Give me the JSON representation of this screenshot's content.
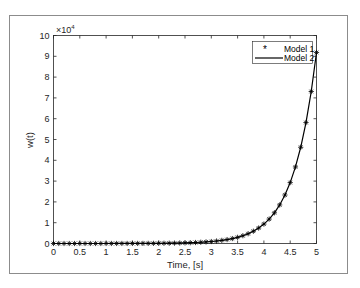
{
  "chart_data": {
    "type": "line",
    "title": "",
    "xlabel": "Time, [s]",
    "ylabel": "w(t)",
    "y_exponent_label": "×10",
    "y_exponent_power": "4",
    "xlim": [
      0,
      5
    ],
    "ylim": [
      0,
      100000
    ],
    "x_ticks": [
      "0",
      "0.5",
      "1",
      "1.5",
      "2",
      "2.5",
      "3",
      "3.5",
      "4",
      "4.5",
      "5"
    ],
    "y_ticks": [
      "0",
      "1",
      "2",
      "3",
      "4",
      "5",
      "6",
      "7",
      "8",
      "9",
      "10"
    ],
    "grid": false,
    "legend_position": "upper right",
    "x": [
      0,
      0.1,
      0.2,
      0.3,
      0.4,
      0.5,
      0.6,
      0.7,
      0.8,
      0.9,
      1,
      1.1,
      1.2,
      1.3,
      1.4,
      1.5,
      1.6,
      1.7,
      1.8,
      1.9,
      2,
      2.1,
      2.2,
      2.3,
      2.4,
      2.5,
      2.6,
      2.7,
      2.8,
      2.9,
      3,
      3.1,
      3.2,
      3.3,
      3.4,
      3.5,
      3.6,
      3.7,
      3.8,
      3.9,
      4,
      4.1,
      4.2,
      4.3,
      4.4,
      4.5,
      4.6,
      4.7,
      4.8,
      4.9,
      5
    ],
    "series": [
      {
        "name": "Model 1",
        "style": "asterisk markers",
        "values": [
          1,
          1.26,
          1.58,
          1.99,
          2.49,
          3.14,
          3.94,
          4.95,
          6.22,
          7.82,
          9.83,
          12.4,
          15.5,
          19.5,
          24.5,
          30.8,
          38.7,
          48.7,
          61.2,
          76.9,
          96.6,
          121,
          153,
          192,
          241,
          303,
          381,
          479,
          602,
          756,
          950,
          1194,
          1500,
          1886,
          2370,
          2979,
          3744,
          4705,
          5913,
          7432,
          9340,
          11739,
          14753,
          18542,
          23304,
          29289,
          36810,
          46263,
          58144,
          73075,
          91840
        ]
      },
      {
        "name": "Model 2",
        "style": "solid line",
        "values": [
          1,
          1.26,
          1.58,
          1.99,
          2.49,
          3.14,
          3.94,
          4.95,
          6.22,
          7.82,
          9.83,
          12.4,
          15.5,
          19.5,
          24.5,
          30.8,
          38.7,
          48.7,
          61.2,
          76.9,
          96.6,
          121,
          153,
          192,
          241,
          303,
          381,
          479,
          602,
          756,
          950,
          1194,
          1500,
          1886,
          2370,
          2979,
          3744,
          4705,
          5913,
          7432,
          9340,
          11739,
          14753,
          18542,
          23304,
          29289,
          36810,
          46263,
          58144,
          73075,
          91840
        ]
      }
    ]
  },
  "legend": {
    "items": [
      {
        "label": "Model 1",
        "symbol": "*"
      },
      {
        "label": "Model 2",
        "symbol": "line"
      }
    ]
  },
  "colors": {
    "axis": "#262626",
    "frame": "#a0a0a0",
    "series": "#000000"
  }
}
